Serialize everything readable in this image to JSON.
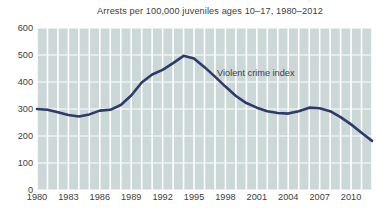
{
  "chart_data": {
    "type": "line",
    "title": "Arrests per 100,000 juveniles ages 10–17, 1980–2012",
    "xlabel": "",
    "ylabel": "",
    "grid": true,
    "legend_position": "inline-annotation",
    "xlim": [
      1980,
      2012
    ],
    "ylim": [
      0,
      600
    ],
    "yticks": [
      0,
      100,
      200,
      300,
      400,
      500,
      600
    ],
    "ytick_labels": [
      "0",
      "100",
      "200",
      "300",
      "400",
      "500",
      "600"
    ],
    "xticks": [
      1980,
      1983,
      1986,
      1989,
      1992,
      1995,
      1998,
      2001,
      2004,
      2007,
      2010
    ],
    "xtick_labels": [
      "1980",
      "1983",
      "1986",
      "1989",
      "1992",
      "1995",
      "1998",
      "2001",
      "2004",
      "2007",
      "2010"
    ],
    "annotations": [
      {
        "text": "Violent crime index",
        "x": 1997.2,
        "y": 430
      }
    ],
    "series": [
      {
        "name": "Violent crime index",
        "color": "#2e3a6b",
        "x": [
          1980,
          1981,
          1982,
          1983,
          1984,
          1985,
          1986,
          1987,
          1988,
          1989,
          1990,
          1991,
          1992,
          1993,
          1994,
          1995,
          1996,
          1997,
          1998,
          1999,
          2000,
          2001,
          2002,
          2003,
          2004,
          2005,
          2006,
          2007,
          2008,
          2009,
          2010,
          2011,
          2012
        ],
        "values": [
          300,
          297,
          288,
          278,
          272,
          280,
          294,
          297,
          315,
          350,
          398,
          428,
          445,
          470,
          497,
          487,
          455,
          420,
          383,
          348,
          322,
          305,
          292,
          285,
          283,
          292,
          305,
          303,
          292,
          270,
          243,
          212,
          182
        ]
      }
    ]
  },
  "colors": {
    "plot_background": "#ccd7d7",
    "gridline": "#ffffff",
    "line": "#2e3a6b",
    "text": "#404040",
    "page_background": "#ffffff"
  }
}
